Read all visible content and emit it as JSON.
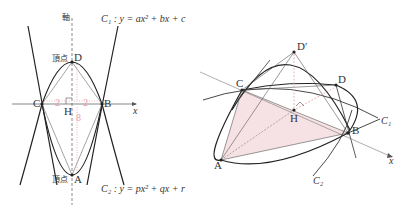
{
  "left_diagram": {
    "axis_label": "軸",
    "x_axis_label": "x",
    "curve1_label": "C₁ : y = ax² + bx + c",
    "curve2_label": "C₂ : y = px² + qx + r",
    "points": {
      "D": "D",
      "D_prefix": "頂点",
      "A": "A",
      "A_prefix": "頂点",
      "C": "C",
      "B": "B",
      "H": "H"
    },
    "measures": {
      "left_half": "2",
      "right_half": "2",
      "height": "8"
    }
  },
  "right_diagram": {
    "points": {
      "D_prime": "D′",
      "D": "D",
      "C": "C",
      "B": "B",
      "A": "A",
      "H": "H"
    },
    "curve1_label": "C₁",
    "curve2_label": "C₂",
    "x_axis_label": "x"
  },
  "colors": {
    "ink": "#333333",
    "accent_red": "#e8a0a8",
    "fill_pink": "#f6e2e4"
  }
}
